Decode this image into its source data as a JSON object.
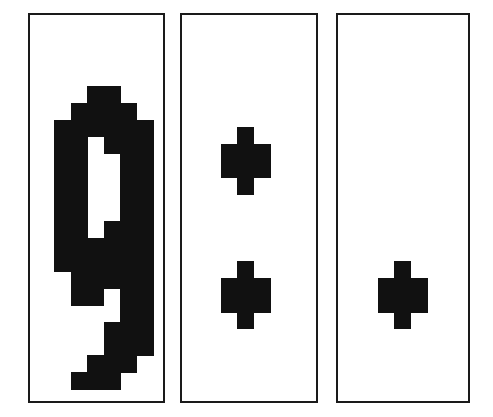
{
  "figure": {
    "title": "",
    "background_color": "#ffffff",
    "width": 493,
    "height": 417,
    "shape_color": "#111111",
    "border_color": "#1a1a1a",
    "panel_fill": "#ffffff"
  },
  "panels": [
    {
      "name": "panel-1",
      "label": "",
      "x": 28,
      "y": 13,
      "width": 137,
      "height": 390,
      "grid": {
        "cell": 17,
        "origin_x": 55,
        "origin_y": 87,
        "cols": 6,
        "rows": 18
      },
      "shape_name": "nine-glyph",
      "cells": [
        [
          2,
          0
        ],
        [
          3,
          0
        ],
        [
          1,
          1
        ],
        [
          2,
          1
        ],
        [
          3,
          1
        ],
        [
          4,
          1
        ],
        [
          0,
          2
        ],
        [
          1,
          2
        ],
        [
          2,
          2
        ],
        [
          3,
          2
        ],
        [
          4,
          2
        ],
        [
          5,
          2
        ],
        [
          0,
          3
        ],
        [
          1,
          3
        ],
        [
          3,
          3
        ],
        [
          4,
          3
        ],
        [
          5,
          3
        ],
        [
          0,
          4
        ],
        [
          1,
          4
        ],
        [
          4,
          4
        ],
        [
          5,
          4
        ],
        [
          0,
          5
        ],
        [
          1,
          5
        ],
        [
          4,
          5
        ],
        [
          5,
          5
        ],
        [
          0,
          6
        ],
        [
          1,
          6
        ],
        [
          4,
          6
        ],
        [
          5,
          6
        ],
        [
          0,
          7
        ],
        [
          1,
          7
        ],
        [
          4,
          7
        ],
        [
          5,
          7
        ],
        [
          0,
          8
        ],
        [
          1,
          8
        ],
        [
          3,
          8
        ],
        [
          4,
          8
        ],
        [
          5,
          8
        ],
        [
          0,
          9
        ],
        [
          1,
          9
        ],
        [
          2,
          9
        ],
        [
          3,
          9
        ],
        [
          4,
          9
        ],
        [
          5,
          9
        ],
        [
          0,
          10
        ],
        [
          1,
          10
        ],
        [
          2,
          10
        ],
        [
          3,
          10
        ],
        [
          4,
          10
        ],
        [
          5,
          10
        ],
        [
          1,
          11
        ],
        [
          2,
          11
        ],
        [
          3,
          11
        ],
        [
          4,
          11
        ],
        [
          5,
          11
        ],
        [
          1,
          12
        ],
        [
          2,
          12
        ],
        [
          4,
          12
        ],
        [
          5,
          12
        ],
        [
          4,
          13
        ],
        [
          5,
          13
        ],
        [
          3,
          14
        ],
        [
          4,
          14
        ],
        [
          5,
          14
        ],
        [
          3,
          15
        ],
        [
          4,
          15
        ],
        [
          5,
          15
        ],
        [
          2,
          16
        ],
        [
          3,
          16
        ],
        [
          4,
          16
        ],
        [
          1,
          17
        ],
        [
          2,
          17
        ],
        [
          3,
          17
        ]
      ]
    },
    {
      "name": "panel-2",
      "label": "",
      "x": 180,
      "y": 13,
      "width": 138,
      "height": 390,
      "grid": {
        "cell": 17,
        "origin_x": 222,
        "origin_y": 128,
        "cols": 3,
        "rows": 13
      },
      "shape_name": "two-crosses",
      "cells": [
        [
          1,
          0
        ],
        [
          0,
          1
        ],
        [
          1,
          1
        ],
        [
          2,
          1
        ],
        [
          0,
          2
        ],
        [
          1,
          2
        ],
        [
          2,
          2
        ],
        [
          1,
          3
        ],
        [
          1,
          8
        ],
        [
          0,
          9
        ],
        [
          1,
          9
        ],
        [
          2,
          9
        ],
        [
          0,
          10
        ],
        [
          1,
          10
        ],
        [
          2,
          10
        ],
        [
          1,
          11
        ]
      ]
    },
    {
      "name": "panel-3",
      "label": "",
      "x": 336,
      "y": 13,
      "width": 134,
      "height": 390,
      "grid": {
        "cell": 17,
        "origin_x": 379,
        "origin_y": 264,
        "cols": 3,
        "rows": 4
      },
      "shape_name": "single-cross",
      "cells": [
        [
          1,
          0
        ],
        [
          0,
          1
        ],
        [
          1,
          1
        ],
        [
          2,
          1
        ],
        [
          0,
          2
        ],
        [
          1,
          2
        ],
        [
          2,
          2
        ],
        [
          1,
          3
        ]
      ]
    }
  ]
}
